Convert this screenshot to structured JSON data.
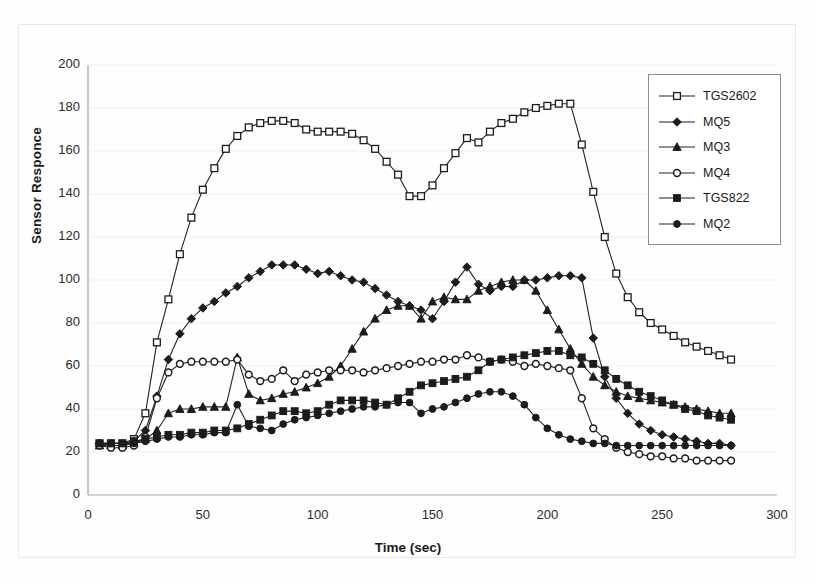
{
  "chart_data": {
    "type": "line",
    "title": "",
    "xlabel": "Time (sec)",
    "ylabel": "Sensor Responce",
    "xlim": [
      0,
      300
    ],
    "ylim": [
      0,
      200
    ],
    "xticks": [
      0,
      50,
      100,
      150,
      200,
      250,
      300
    ],
    "yticks": [
      0,
      20,
      40,
      60,
      80,
      100,
      120,
      140,
      160,
      180,
      200
    ],
    "grid": "horizontal-faint",
    "legend_position": "upper-right-inside",
    "marker_map": {
      "TGS2602": "open-square",
      "MQ5": "filled-diamond",
      "MQ3": "filled-triangle",
      "MQ4": "open-circle",
      "TGS822": "filled-square",
      "MQ2": "filled-circle"
    },
    "x": [
      5,
      10,
      15,
      20,
      25,
      30,
      35,
      40,
      45,
      50,
      55,
      60,
      65,
      70,
      75,
      80,
      85,
      90,
      95,
      100,
      105,
      110,
      115,
      120,
      125,
      130,
      135,
      140,
      145,
      150,
      155,
      160,
      165,
      170,
      175,
      180,
      185,
      190,
      195,
      200,
      205,
      210,
      215,
      220,
      225,
      230,
      235,
      240,
      245,
      250,
      255,
      260,
      265,
      270,
      275,
      280
    ],
    "series": [
      {
        "name": "TGS2602",
        "marker": "open-square",
        "values": [
          24,
          24,
          24,
          26,
          38,
          71,
          91,
          112,
          129,
          142,
          152,
          161,
          167,
          171,
          173,
          174,
          174,
          173,
          170,
          169,
          169,
          169,
          168,
          165,
          161,
          155,
          149,
          139,
          139,
          144,
          152,
          159,
          166,
          164,
          169,
          173,
          175,
          178,
          180,
          181,
          182,
          182,
          163,
          141,
          120,
          103,
          92,
          85,
          80,
          77,
          74,
          71,
          69,
          67,
          65,
          63
        ]
      },
      {
        "name": "MQ5",
        "marker": "filled-diamond",
        "values": [
          24,
          23,
          23,
          25,
          30,
          46,
          63,
          75,
          82,
          87,
          90,
          94,
          97,
          101,
          104,
          107,
          107,
          107,
          105,
          103,
          104,
          102,
          100,
          99,
          96,
          93,
          90,
          88,
          86,
          82,
          90,
          99,
          106,
          98,
          95,
          97,
          97,
          100,
          100,
          101,
          102,
          102,
          101,
          73,
          55,
          45,
          38,
          33,
          30,
          28,
          27,
          26,
          25,
          24,
          24,
          23
        ]
      },
      {
        "name": "MQ3",
        "marker": "filled-triangle",
        "values": [
          23,
          23,
          23,
          24,
          26,
          30,
          38,
          40,
          40,
          41,
          41,
          41,
          64,
          47,
          44,
          45,
          47,
          48,
          50,
          52,
          55,
          60,
          68,
          76,
          82,
          86,
          88,
          88,
          82,
          90,
          92,
          91,
          91,
          95,
          97,
          99,
          100,
          100,
          95,
          86,
          77,
          68,
          61,
          55,
          51,
          48,
          46,
          45,
          44,
          43,
          42,
          41,
          40,
          39,
          38,
          38
        ]
      },
      {
        "name": "MQ4",
        "marker": "open-circle",
        "values": [
          23,
          22,
          22,
          23,
          27,
          45,
          57,
          61,
          62,
          62,
          62,
          62,
          63,
          56,
          53,
          54,
          58,
          53,
          56,
          57,
          58,
          58,
          58,
          57,
          58,
          59,
          60,
          61,
          62,
          62,
          63,
          63,
          65,
          64,
          62,
          63,
          62,
          60,
          61,
          60,
          59,
          58,
          45,
          31,
          26,
          22,
          20,
          19,
          18,
          18,
          17,
          17,
          16,
          16,
          16,
          16
        ]
      },
      {
        "name": "TGS822",
        "marker": "filled-square",
        "values": [
          24,
          24,
          24,
          25,
          26,
          27,
          28,
          28,
          29,
          29,
          30,
          30,
          31,
          33,
          35,
          37,
          39,
          39,
          38,
          39,
          42,
          44,
          44,
          44,
          43,
          42,
          45,
          48,
          51,
          52,
          53,
          54,
          55,
          58,
          62,
          63,
          64,
          65,
          66,
          67,
          67,
          65,
          64,
          61,
          58,
          54,
          51,
          48,
          46,
          44,
          42,
          40,
          39,
          37,
          36,
          35
        ]
      },
      {
        "name": "MQ2",
        "marker": "filled-circle",
        "values": [
          24,
          24,
          24,
          24,
          25,
          26,
          27,
          27,
          28,
          28,
          29,
          29,
          42,
          32,
          31,
          30,
          33,
          35,
          36,
          37,
          38,
          39,
          40,
          41,
          41,
          42,
          43,
          43,
          38,
          40,
          41,
          43,
          45,
          47,
          48,
          48,
          46,
          42,
          36,
          31,
          28,
          26,
          25,
          24,
          24,
          23,
          23,
          23,
          23,
          23,
          23,
          23,
          23,
          23,
          23,
          23
        ]
      }
    ]
  },
  "legend": {
    "items": [
      {
        "label": "TGS2602",
        "marker": "open-square"
      },
      {
        "label": "MQ5",
        "marker": "filled-diamond"
      },
      {
        "label": "MQ3",
        "marker": "filled-triangle"
      },
      {
        "label": "MQ4",
        "marker": "open-circle"
      },
      {
        "label": "TGS822",
        "marker": "filled-square"
      },
      {
        "label": "MQ2",
        "marker": "filled-circle"
      }
    ]
  },
  "colors": {
    "line": "#222222",
    "axis": "#a6a6a6",
    "grid": "#f0f0f0",
    "text": "#1a1a1a",
    "legend_border": "#8e8e8e"
  }
}
